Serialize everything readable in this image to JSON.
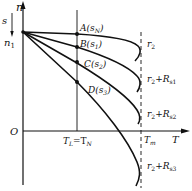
{
  "diagram": {
    "type": "mechanical-characteristic",
    "axes": {
      "y_label": "n",
      "x_label": "T",
      "origin_label": "O",
      "slip_label": "s",
      "sync_speed_label": "n",
      "sync_speed_sub": "1"
    },
    "load_line": {
      "label_main": "T",
      "label_sub": "L",
      "eq": "=T",
      "eq_sub": "N"
    },
    "max_torque": {
      "label_main": "T",
      "label_sub": "m"
    },
    "points": [
      {
        "id": "A",
        "text": "A(s",
        "sub": "N",
        "close": ")"
      },
      {
        "id": "B",
        "text": "B(s",
        "sub": "1",
        "close": ")"
      },
      {
        "id": "C",
        "text": "C(s",
        "sub": "2",
        "close": ")"
      },
      {
        "id": "D",
        "text": "D(s",
        "sub": "3",
        "close": ")"
      }
    ],
    "curves": [
      {
        "main": "r",
        "sub": "2",
        "plus": "",
        "R": "",
        "Rsub": ""
      },
      {
        "main": "r",
        "sub": "2",
        "plus": "+",
        "R": "R",
        "Rsub": "s1"
      },
      {
        "main": "r",
        "sub": "2",
        "plus": "+",
        "R": "R",
        "Rsub": "s2"
      },
      {
        "main": "r",
        "sub": "2",
        "plus": "+",
        "R": "R",
        "Rsub": "s3"
      }
    ]
  }
}
